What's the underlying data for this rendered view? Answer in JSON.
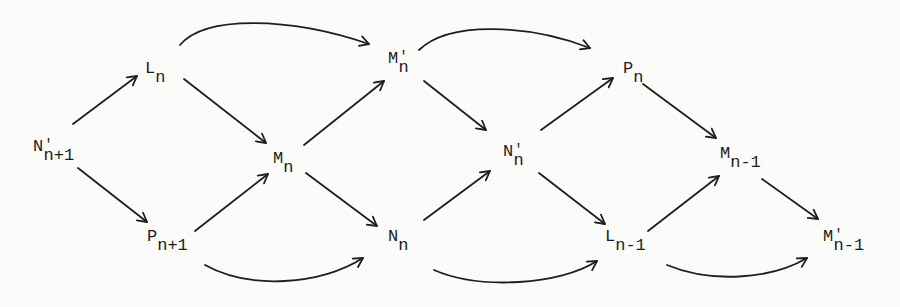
{
  "diagram": {
    "type": "commutative-diagram",
    "nodes": [
      {
        "id": "Np_n+1",
        "base": "N",
        "prime": "'",
        "sub": "n+1",
        "x": 33,
        "y": 138
      },
      {
        "id": "L_n",
        "base": "L",
        "prime": "",
        "sub": "n",
        "x": 145,
        "y": 60
      },
      {
        "id": "P_n+1",
        "base": "P",
        "prime": "",
        "sub": "n+1",
        "x": 147,
        "y": 228
      },
      {
        "id": "M_n",
        "base": "M",
        "prime": "",
        "sub": "n",
        "x": 273,
        "y": 150
      },
      {
        "id": "Mp_n",
        "base": "M",
        "prime": "'",
        "sub": "n",
        "x": 388,
        "y": 50
      },
      {
        "id": "N_n",
        "base": "N",
        "prime": "",
        "sub": "n",
        "x": 388,
        "y": 228
      },
      {
        "id": "Np_n",
        "base": "N",
        "prime": "'",
        "sub": "n",
        "x": 503,
        "y": 143
      },
      {
        "id": "P_n",
        "base": "P",
        "prime": "",
        "sub": "n",
        "x": 623,
        "y": 60
      },
      {
        "id": "L_n-1",
        "base": "L",
        "prime": "",
        "sub": "n-1",
        "x": 605,
        "y": 228
      },
      {
        "id": "M_n-1",
        "base": "M",
        "prime": "",
        "sub": "n-1",
        "x": 720,
        "y": 145
      },
      {
        "id": "Mp_n-1",
        "base": "M",
        "prime": "'",
        "sub": "n-1",
        "x": 823,
        "y": 228
      }
    ],
    "edges": [
      {
        "from": "Np_n+1",
        "to": "L_n",
        "style": "straight"
      },
      {
        "from": "Np_n+1",
        "to": "P_n+1",
        "style": "straight"
      },
      {
        "from": "L_n",
        "to": "M_n",
        "style": "straight"
      },
      {
        "from": "P_n+1",
        "to": "M_n",
        "style": "straight"
      },
      {
        "from": "L_n",
        "to": "Mp_n",
        "style": "curved"
      },
      {
        "from": "P_n+1",
        "to": "N_n",
        "style": "curved"
      },
      {
        "from": "M_n",
        "to": "Mp_n",
        "style": "straight"
      },
      {
        "from": "M_n",
        "to": "N_n",
        "style": "straight"
      },
      {
        "from": "Mp_n",
        "to": "Np_n",
        "style": "straight"
      },
      {
        "from": "N_n",
        "to": "Np_n",
        "style": "straight"
      },
      {
        "from": "Mp_n",
        "to": "P_n",
        "style": "curved"
      },
      {
        "from": "N_n",
        "to": "L_n-1",
        "style": "curved"
      },
      {
        "from": "Np_n",
        "to": "P_n",
        "style": "straight"
      },
      {
        "from": "Np_n",
        "to": "L_n-1",
        "style": "straight"
      },
      {
        "from": "P_n",
        "to": "M_n-1",
        "style": "straight"
      },
      {
        "from": "L_n-1",
        "to": "M_n-1",
        "style": "straight"
      },
      {
        "from": "M_n-1",
        "to": "Mp_n-1",
        "style": "straight"
      },
      {
        "from": "L_n-1",
        "to": "Mp_n-1",
        "style": "curved"
      }
    ]
  },
  "labels": {
    "Np_n+1": {
      "base": "N",
      "prime": "'",
      "sub": "n+1"
    },
    "L_n": {
      "base": "L",
      "prime": "",
      "sub": "n"
    },
    "P_n+1": {
      "base": "P",
      "prime": "",
      "sub": "n+1"
    },
    "M_n": {
      "base": "M",
      "prime": "",
      "sub": "n"
    },
    "Mp_n": {
      "base": "M",
      "prime": "'",
      "sub": "n"
    },
    "N_n": {
      "base": "N",
      "prime": "",
      "sub": "n"
    },
    "Np_n": {
      "base": "N",
      "prime": "'",
      "sub": "n"
    },
    "P_n": {
      "base": "P",
      "prime": "",
      "sub": "n"
    },
    "L_n-1": {
      "base": "L",
      "prime": "",
      "sub": "n-1"
    },
    "M_n-1": {
      "base": "M",
      "prime": "",
      "sub": "n-1"
    },
    "Mp_n-1": {
      "base": "M",
      "prime": "'",
      "sub": "n-1"
    }
  },
  "colors": {
    "ink": "#1e1e1e",
    "paper": "#fbfbf9"
  }
}
